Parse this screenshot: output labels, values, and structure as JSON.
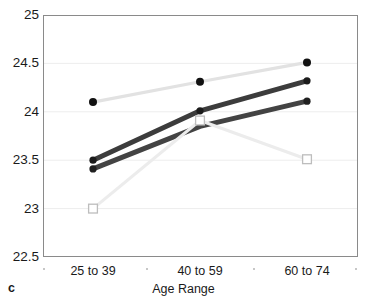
{
  "panel": {
    "label": "c"
  },
  "chart_data": {
    "type": "line",
    "title": "",
    "xlabel": "Age Range",
    "ylabel": "",
    "categories": [
      "25 to 39",
      "40 to 59",
      "60 to 74"
    ],
    "ylim": [
      22.5,
      25.0
    ],
    "yticks": [
      "22.5",
      "23",
      "23.5",
      "24",
      "24.5",
      "25"
    ],
    "ytick_values": [
      22.5,
      23,
      23.5,
      24,
      24.5,
      25
    ],
    "grid": true,
    "legend": "none",
    "series": [
      {
        "name": "series-1-light-line-black-dots",
        "values": [
          24.1,
          24.31,
          24.51
        ],
        "line_color": "#e2e2e2",
        "marker": "circle",
        "marker_color": "#111111",
        "line_width": 3.2,
        "marker_size": 4.0
      },
      {
        "name": "series-2-dark-upper",
        "values": [
          23.5,
          24.01,
          24.32
        ],
        "line_color": "#3c3c3c",
        "marker": "circle",
        "marker_color": "#1b1b1b",
        "line_width": 5.0,
        "marker_size": 3.6
      },
      {
        "name": "series-3-dark-lower",
        "values": [
          23.41,
          23.85,
          24.11
        ],
        "line_color": "#434343",
        "marker": "circle",
        "marker_color": "#202020",
        "line_width": 5.0,
        "marker_size": 3.6,
        "marker_at": [
          0,
          2
        ]
      },
      {
        "name": "series-4-lightest-open-squares",
        "values": [
          23.0,
          23.91,
          23.51
        ],
        "line_color": "#ececec",
        "marker": "square",
        "marker_color": "#bdbdbd",
        "line_width": 3.0,
        "marker_size": 4.4
      }
    ],
    "axis_minor_ticks": [
      44,
      147,
      254,
      356
    ]
  },
  "colors": {
    "plot_border": "#8a8a8a",
    "gridline": "#ededed",
    "background": "#ffffff",
    "text": "#1a1a1a"
  }
}
